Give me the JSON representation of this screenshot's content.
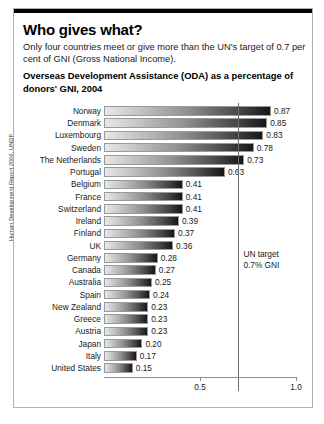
{
  "headline": "Who gives what?",
  "standfirst": "Only four countries meet or give more than the UN's target of 0.7 per cent of GNI (Gross National Income).",
  "source_credit": "Human Development Report 2006, UNDP",
  "annotation": {
    "line1": "UN target",
    "line2": "0.7% GNI",
    "value": 0.7
  },
  "chart_data": {
    "type": "bar",
    "orientation": "horizontal",
    "title": "Overseas Development Assistance (ODA) as a percentage of donors' GNI, 2004",
    "xlabel": "",
    "ylabel": "",
    "xlim": [
      0,
      1.0
    ],
    "ticks": [
      "0.5",
      "1.0"
    ],
    "tick_values": [
      0.5,
      1.0
    ],
    "grid": false,
    "legend": false,
    "categories": [
      "Norway",
      "Denmark",
      "Luxembourg",
      "Sweden",
      "The Netherlands",
      "Portugal",
      "Belgium",
      "France",
      "Switzerland",
      "Ireland",
      "Finland",
      "UK",
      "Germany",
      "Canada",
      "Australia",
      "Spain",
      "New Zealand",
      "Greece",
      "Austria",
      "Japan",
      "Italy",
      "United States"
    ],
    "values": [
      0.87,
      0.85,
      0.83,
      0.78,
      0.73,
      0.63,
      0.41,
      0.41,
      0.41,
      0.39,
      0.37,
      0.36,
      0.28,
      0.27,
      0.25,
      0.24,
      0.23,
      0.23,
      0.23,
      0.2,
      0.17,
      0.15
    ],
    "value_labels": [
      "0.87",
      "0.85",
      "0.83",
      "0.78",
      "0.73",
      "0.63",
      "0.41",
      "0.41",
      "0.41",
      "0.39",
      "0.37",
      "0.36",
      "0.28",
      "0.27",
      "0.25",
      "0.24",
      "0.23",
      "0.23",
      "0.23",
      "0.20",
      "0.17",
      "0.15"
    ]
  }
}
